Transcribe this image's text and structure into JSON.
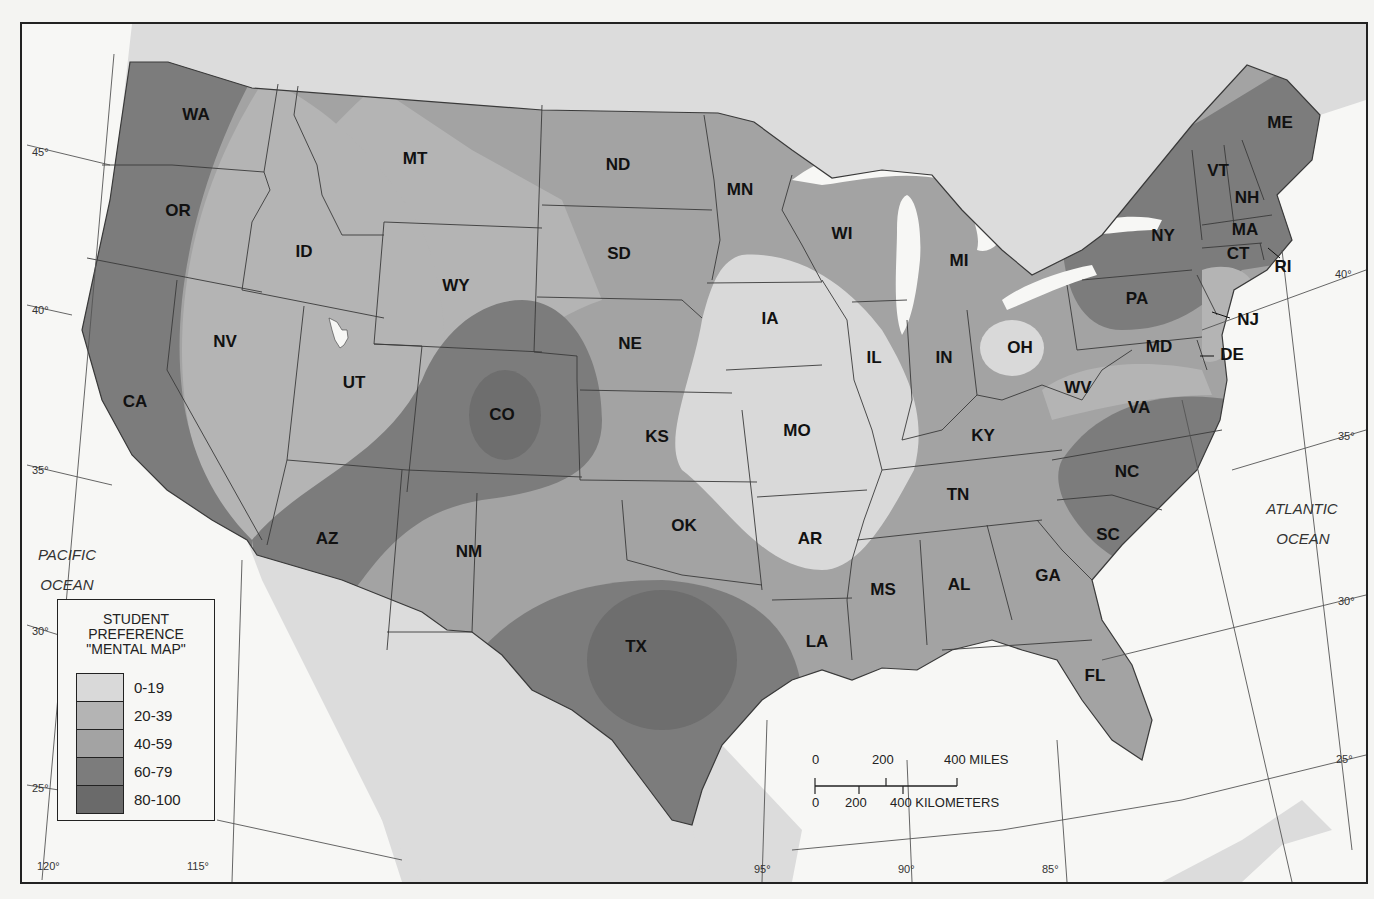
{
  "map": {
    "title_lines": [
      "STUDENT",
      "PREFERENCE",
      "\"MENTAL MAP\""
    ],
    "colors": {
      "land_outside_us": "#dedede",
      "water": "#f7f7f5",
      "border_line": "#3a3a3a"
    },
    "oceans": [
      {
        "name": "pacific",
        "lines": [
          "PACIFIC",
          "OCEAN"
        ]
      },
      {
        "name": "atlantic",
        "lines": [
          "ATLANTIC",
          "OCEAN"
        ]
      }
    ],
    "latitude_labels": [
      "45°",
      "40°",
      "35°",
      "30°",
      "25°"
    ],
    "longitude_labels": [
      "120°",
      "115°",
      "95°",
      "90°",
      "85°"
    ],
    "states": [
      {
        "abbr": "WA",
        "band": "60-79"
      },
      {
        "abbr": "OR",
        "band": "60-79"
      },
      {
        "abbr": "CA",
        "band": "60-79"
      },
      {
        "abbr": "ID",
        "band": "20-39"
      },
      {
        "abbr": "NV",
        "band": "20-39"
      },
      {
        "abbr": "MT",
        "band": "40-59"
      },
      {
        "abbr": "WY",
        "band": "20-39"
      },
      {
        "abbr": "UT",
        "band": "20-39"
      },
      {
        "abbr": "CO",
        "band": "80-100"
      },
      {
        "abbr": "AZ",
        "band": "60-79"
      },
      {
        "abbr": "NM",
        "band": "40-59"
      },
      {
        "abbr": "ND",
        "band": "40-59"
      },
      {
        "abbr": "SD",
        "band": "40-59"
      },
      {
        "abbr": "NE",
        "band": "40-59"
      },
      {
        "abbr": "KS",
        "band": "40-59"
      },
      {
        "abbr": "OK",
        "band": "40-59"
      },
      {
        "abbr": "TX",
        "band": "80-100"
      },
      {
        "abbr": "MN",
        "band": "40-59"
      },
      {
        "abbr": "IA",
        "band": "0-19"
      },
      {
        "abbr": "MO",
        "band": "0-19"
      },
      {
        "abbr": "AR",
        "band": "0-19"
      },
      {
        "abbr": "LA",
        "band": "40-59"
      },
      {
        "abbr": "WI",
        "band": "40-59"
      },
      {
        "abbr": "IL",
        "band": "0-19"
      },
      {
        "abbr": "MI",
        "band": "40-59"
      },
      {
        "abbr": "IN",
        "band": "40-59"
      },
      {
        "abbr": "OH",
        "band": "0-19"
      },
      {
        "abbr": "KY",
        "band": "40-59"
      },
      {
        "abbr": "TN",
        "band": "40-59"
      },
      {
        "abbr": "MS",
        "band": "40-59"
      },
      {
        "abbr": "AL",
        "band": "40-59"
      },
      {
        "abbr": "GA",
        "band": "40-59"
      },
      {
        "abbr": "FL",
        "band": "40-59"
      },
      {
        "abbr": "SC",
        "band": "60-79"
      },
      {
        "abbr": "NC",
        "band": "60-79"
      },
      {
        "abbr": "VA",
        "band": "40-59"
      },
      {
        "abbr": "WV",
        "band": "20-39"
      },
      {
        "abbr": "MD",
        "band": "40-59"
      },
      {
        "abbr": "DE",
        "band": "20-39"
      },
      {
        "abbr": "PA",
        "band": "60-79"
      },
      {
        "abbr": "NJ",
        "band": "20-39"
      },
      {
        "abbr": "NY",
        "band": "60-79"
      },
      {
        "abbr": "CT",
        "band": "40-59"
      },
      {
        "abbr": "RI",
        "band": "40-59"
      },
      {
        "abbr": "MA",
        "band": "60-79"
      },
      {
        "abbr": "VT",
        "band": "60-79"
      },
      {
        "abbr": "NH",
        "band": "60-79"
      },
      {
        "abbr": "ME",
        "band": "60-79"
      }
    ]
  },
  "legend": {
    "title_lines": [
      "STUDENT",
      "PREFERENCE",
      "\"MENTAL MAP\""
    ],
    "items": [
      {
        "label": "0-19",
        "color": "#d9d9d9"
      },
      {
        "label": "20-39",
        "color": "#b4b4b4"
      },
      {
        "label": "40-59",
        "color": "#a3a3a3"
      },
      {
        "label": "60-79",
        "color": "#7c7c7c"
      },
      {
        "label": "80-100",
        "color": "#6a6a6a"
      }
    ]
  },
  "scale": {
    "miles_ticks": [
      "0",
      "200",
      "400 MILES"
    ],
    "km_ticks": [
      "0",
      "200",
      "400 KILOMETERS"
    ]
  }
}
